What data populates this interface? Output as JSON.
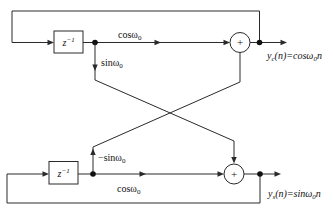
{
  "diagram": {
    "background": "#ffffff",
    "line_color": "#2a2a2a",
    "delay_blocks": {
      "top": {
        "base": "z",
        "sup": "−1"
      },
      "bottom": {
        "base": "z",
        "sup": "−1"
      }
    },
    "gain_labels": {
      "cos_top": {
        "base": "cosω",
        "sub": "0"
      },
      "sin_top": {
        "base": "sinω",
        "sub": "0"
      },
      "neg_sin_bottom": {
        "base": "−sinω",
        "sub": "0"
      },
      "cos_bottom": {
        "base": "cosω",
        "sub": "0"
      }
    },
    "adders": {
      "top_symbol": "+",
      "bottom_symbol": "+"
    },
    "output_labels": {
      "cosine": {
        "base": "y",
        "sub": "c",
        "mid": "(n)=cosω",
        "sub2": "0",
        "end": "n"
      },
      "sine": {
        "base": "y",
        "sub": "s",
        "mid": "(n)=sinω",
        "sub2": "0",
        "end": "n"
      }
    }
  }
}
